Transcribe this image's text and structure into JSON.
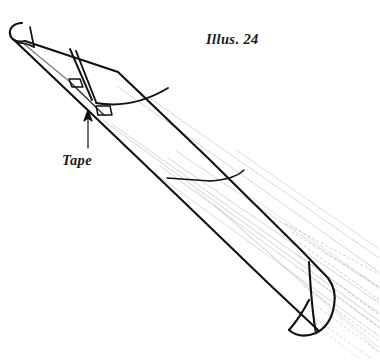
{
  "figure": {
    "caption": "Illus. 24",
    "background_color": "#ffffff",
    "ink_color": "#111111",
    "faint_line_color": "#a9a9a9",
    "labels": [
      {
        "id": "illus",
        "text": "Illus. 24",
        "style": "italic-serif"
      },
      {
        "id": "tape",
        "text": "Tape",
        "style": "italic-serif"
      }
    ],
    "annotations": [
      {
        "name": "tape-callout",
        "label": "Tape",
        "arrow": "points up-right from label to the taped seam"
      }
    ],
    "parts": [
      {
        "name": "cone-body",
        "description": "long tapered rolled tube running from upper-left to lower-right"
      },
      {
        "name": "narrow-tip",
        "description": "rounded closed tip at upper left"
      },
      {
        "name": "wide-mouth",
        "description": "flared elliptical opening at lower right"
      },
      {
        "name": "seam-edge",
        "description": "overlapping paper edge along the lower side"
      },
      {
        "name": "tape-strip",
        "description": "two short strips of tape across the seam near the tip"
      },
      {
        "name": "guide-lines",
        "description": "faint gray parallel construction lines radiating past the wide end"
      }
    ]
  }
}
